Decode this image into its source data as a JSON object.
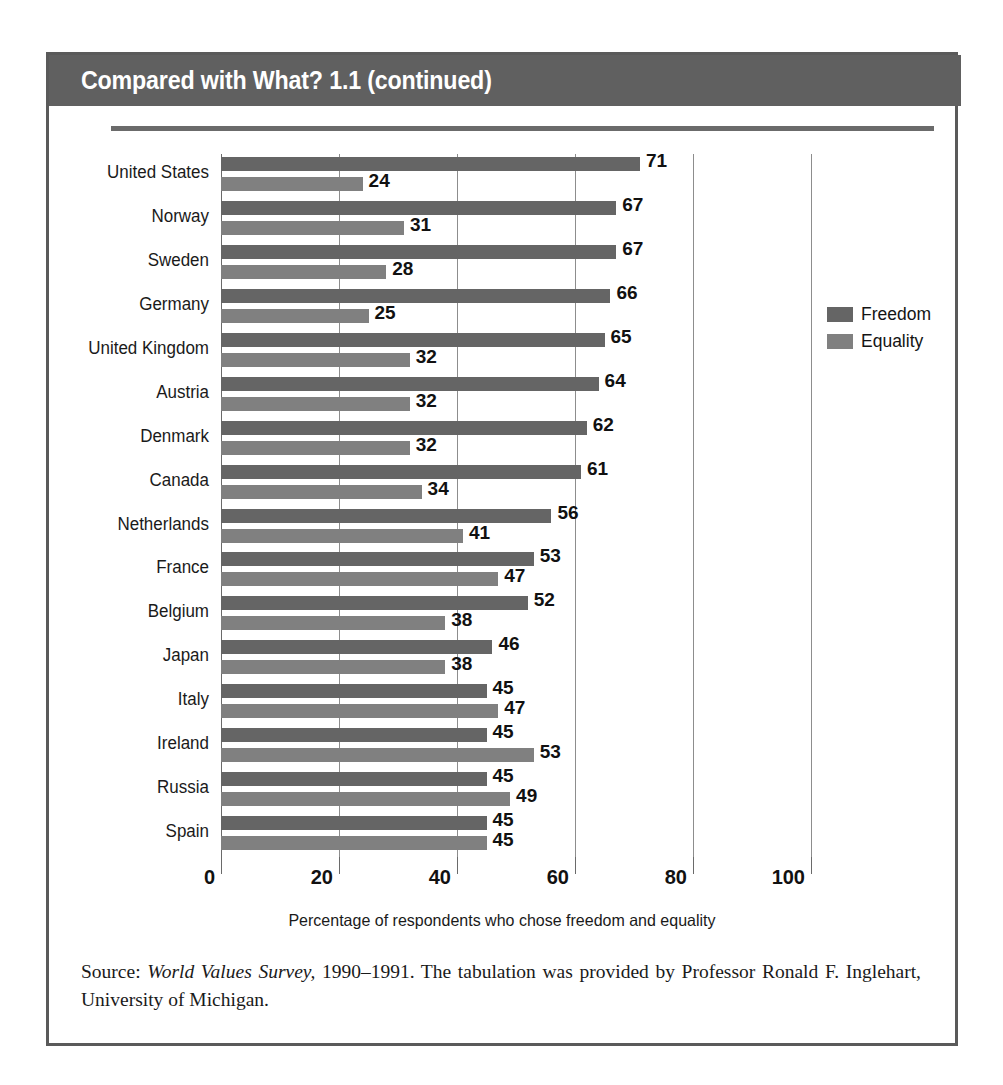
{
  "figure": {
    "title": "Compared with What? 1.1 (continued)",
    "axis_title": "Percentage of respondents who chose freedom and equality",
    "source": {
      "prefix": "Source: ",
      "italic_title": "World Values Survey,",
      "rest": " 1990–1991. The tabulation was provided by Professor Ronald F. Inglehart, University of Michigan."
    }
  },
  "legend": {
    "position": "right",
    "items": [
      {
        "label": "Freedom",
        "color": "#656565"
      },
      {
        "label": "Equality",
        "color": "#808080"
      }
    ]
  },
  "chart_data": {
    "type": "bar",
    "orientation": "horizontal",
    "title": "Compared with What? 1.1 (continued)",
    "xlabel": "Percentage of respondents who chose freedom and equality",
    "ylabel": "",
    "xlim": [
      0,
      100
    ],
    "xticks": [
      0,
      20,
      40,
      60,
      80,
      100
    ],
    "xtick_labels": [
      "0",
      "20",
      "40",
      "60",
      "80",
      "100"
    ],
    "grid": "vertical",
    "legend_position": "right",
    "categories": [
      "United States",
      "Norway",
      "Sweden",
      "Germany",
      "United Kingdom",
      "Austria",
      "Denmark",
      "Canada",
      "Netherlands",
      "France",
      "Belgium",
      "Japan",
      "Italy",
      "Ireland",
      "Russia",
      "Spain"
    ],
    "series": [
      {
        "name": "Freedom",
        "color": "#656565",
        "values": [
          71,
          67,
          67,
          66,
          65,
          64,
          62,
          61,
          56,
          53,
          52,
          46,
          45,
          45,
          45,
          45
        ]
      },
      {
        "name": "Equality",
        "color": "#808080",
        "values": [
          24,
          31,
          28,
          25,
          32,
          32,
          32,
          34,
          41,
          47,
          38,
          38,
          47,
          53,
          49,
          45
        ]
      }
    ]
  },
  "colors": {
    "header_band": "#606060",
    "frame": "#5a5a5a",
    "gridline": "#8d8d8d",
    "freedom": "#656565",
    "equality": "#808080"
  }
}
